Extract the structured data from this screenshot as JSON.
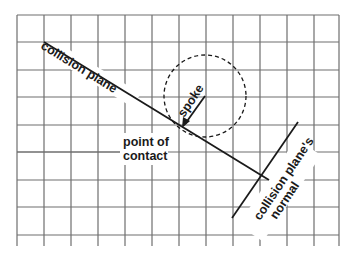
{
  "diagram": {
    "labels": {
      "collision_plane": "collision plane",
      "spoke": "spoke",
      "point_of_contact_line1": "point of",
      "point_of_contact_line2": "contact",
      "normal_line1": "collision plane's",
      "normal_line2": "normal"
    },
    "grid": {
      "x_lines": [
        17,
        44,
        71,
        98,
        125,
        152,
        179,
        206,
        233,
        260,
        287,
        314,
        339
      ],
      "y_lines": [
        15,
        42,
        70,
        97,
        125,
        152,
        180,
        207,
        235
      ],
      "bottom_extent": 246,
      "color": "#6e6e6e"
    },
    "colors": {
      "line": "#1a1a1a",
      "grid": "#6e6e6e",
      "background": "#ffffff"
    }
  }
}
